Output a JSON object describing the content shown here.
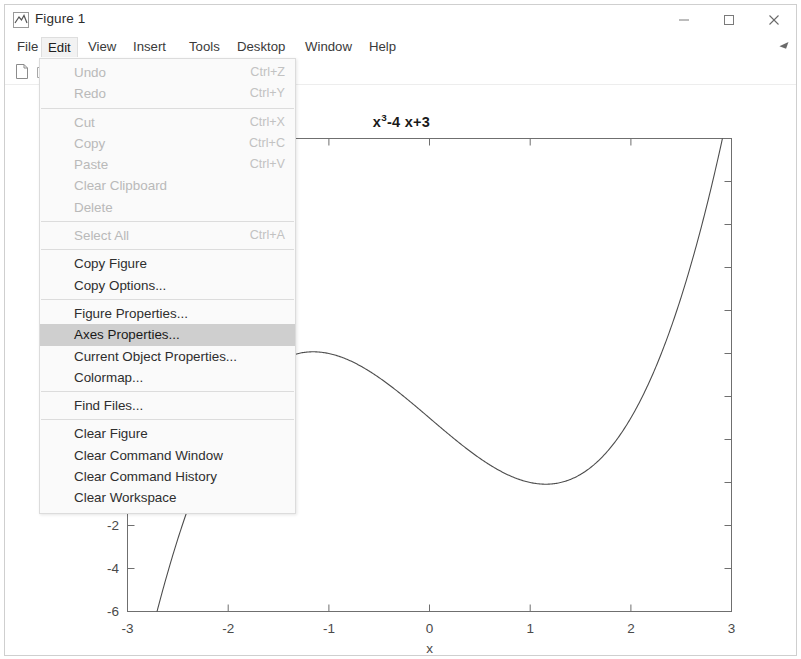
{
  "window": {
    "title": "Figure 1",
    "icon": "matlab-figure-icon",
    "controls": {
      "minimize": "–",
      "maximize": "□",
      "close": "✕"
    }
  },
  "menu_bar": {
    "items": [
      {
        "label": "File",
        "active": false,
        "left": 6
      },
      {
        "label": "Edit",
        "active": true,
        "left": 36
      },
      {
        "label": "View",
        "active": false,
        "left": 77
      },
      {
        "label": "Insert",
        "active": false,
        "left": 122
      },
      {
        "label": "Tools",
        "active": false,
        "left": 178
      },
      {
        "label": "Desktop",
        "active": false,
        "left": 226
      },
      {
        "label": "Window",
        "active": false,
        "left": 294
      },
      {
        "label": "Help",
        "active": false,
        "left": 358
      }
    ]
  },
  "toolbar": {
    "buttons": [
      {
        "name": "new-figure-icon",
        "label": "New Figure"
      },
      {
        "name": "open-file-icon",
        "label": "Open File"
      }
    ]
  },
  "edit_menu": {
    "open": true,
    "items": [
      {
        "label": "Undo",
        "shortcut": "Ctrl+Z",
        "state": "disabled"
      },
      {
        "label": "Redo",
        "shortcut": "Ctrl+Y",
        "state": "disabled"
      },
      {
        "separator": true
      },
      {
        "label": "Cut",
        "shortcut": "Ctrl+X",
        "state": "disabled"
      },
      {
        "label": "Copy",
        "shortcut": "Ctrl+C",
        "state": "disabled"
      },
      {
        "label": "Paste",
        "shortcut": "Ctrl+V",
        "state": "disabled"
      },
      {
        "label": "Clear Clipboard",
        "shortcut": "",
        "state": "disabled"
      },
      {
        "label": "Delete",
        "shortcut": "",
        "state": "disabled"
      },
      {
        "separator": true
      },
      {
        "label": "Select All",
        "shortcut": "Ctrl+A",
        "state": "disabled"
      },
      {
        "separator": true
      },
      {
        "label": "Copy Figure",
        "shortcut": "",
        "state": "enabled"
      },
      {
        "label": "Copy Options...",
        "shortcut": "",
        "state": "enabled"
      },
      {
        "separator": true
      },
      {
        "label": "Figure Properties...",
        "shortcut": "",
        "state": "enabled"
      },
      {
        "label": "Axes Properties...",
        "shortcut": "",
        "state": "highlight"
      },
      {
        "label": "Current Object Properties...",
        "shortcut": "",
        "state": "enabled"
      },
      {
        "label": "Colormap...",
        "shortcut": "",
        "state": "enabled"
      },
      {
        "separator": true
      },
      {
        "label": "Find Files...",
        "shortcut": "",
        "state": "enabled"
      },
      {
        "separator": true
      },
      {
        "label": "Clear Figure",
        "shortcut": "",
        "state": "enabled"
      },
      {
        "label": "Clear Command Window",
        "shortcut": "",
        "state": "enabled"
      },
      {
        "label": "Clear Command History",
        "shortcut": "",
        "state": "enabled"
      },
      {
        "label": "Clear Workspace",
        "shortcut": "",
        "state": "enabled"
      }
    ]
  },
  "chart_data": {
    "type": "line",
    "title_base": "x",
    "title_exponent": "3",
    "title_rest": "-4 x+3",
    "xlabel": "x",
    "ylabel": "",
    "xlim": [
      -3,
      3
    ],
    "ylim": [
      -6,
      16
    ],
    "xticks": [
      -3,
      -2,
      -1,
      0,
      1,
      2,
      3
    ],
    "xticklabels": [
      "-3",
      "-2",
      "-1",
      "0",
      "1",
      "2",
      "3"
    ],
    "yticks": [
      -6,
      -4,
      -2,
      0,
      2,
      4,
      6,
      8,
      10,
      12,
      14,
      16
    ],
    "yticklabels_visible": [
      "-6",
      "-4",
      "-2",
      "0"
    ],
    "grid": false,
    "legend": null,
    "line_color": "#4d4d4d",
    "series": [
      {
        "name": "x^3-4x+3",
        "x": [
          -3.0,
          -2.8,
          -2.6,
          -2.4,
          -2.2,
          -2.0,
          -1.8,
          -1.6,
          -1.4,
          -1.2,
          -1.0,
          -0.8,
          -0.6,
          -0.4,
          -0.2,
          0.0,
          0.2,
          0.4,
          0.6,
          0.8,
          1.0,
          1.2,
          1.4,
          1.6,
          1.8,
          2.0,
          2.2,
          2.4,
          2.6,
          2.8,
          3.0
        ],
        "y": [
          -12.0,
          -7.752,
          -4.976,
          -3.424,
          -961,
          -1.0,
          0.368,
          1.304,
          1.856,
          2.072,
          2.0,
          1.688,
          1.184,
          0.536,
          -0.208,
          3.0,
          2.208,
          1.464,
          0.816,
          0.312,
          0.0,
          -0.072,
          0.144,
          0.696,
          1.632,
          3.0,
          4.848,
          7.224,
          10.176,
          13.752,
          18.0
        ]
      }
    ],
    "curve_notes": {
      "local_max": {
        "x": -1.1547,
        "y": 6.0792
      },
      "local_min": {
        "x": 1.1547,
        "y": -0.0792
      },
      "visible_top_exit_x": 2.8
    }
  }
}
